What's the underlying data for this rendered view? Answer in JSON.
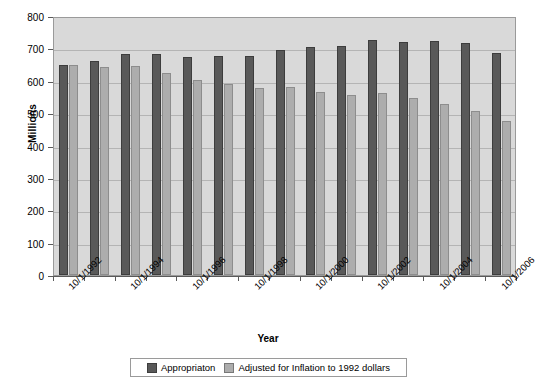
{
  "chart_data": {
    "type": "bar",
    "title": "",
    "xlabel": "Year",
    "ylabel": "Millions",
    "ylim": [
      0,
      800
    ],
    "ytick_step": 100,
    "yticks": [
      0,
      100,
      200,
      300,
      400,
      500,
      600,
      700,
      800
    ],
    "grid": true,
    "legend_position": "bottom",
    "categories": [
      "10/1/1992",
      "10/1/1993",
      "10/1/1994",
      "10/1/1995",
      "10/1/1996",
      "10/1/1997",
      "10/1/1998",
      "10/1/1999",
      "10/1/2000",
      "10/1/2001",
      "10/1/2002",
      "10/1/2003",
      "10/1/2004",
      "10/1/2005",
      "10/1/2006"
    ],
    "visible_tick_labels": [
      "10/1/1992",
      "",
      "10/1/1994",
      "",
      "10/1/1996",
      "",
      "10/1/1998",
      "",
      "10/1/2000",
      "",
      "10/1/2002",
      "",
      "10/1/2004",
      "",
      "10/1/2006"
    ],
    "series": [
      {
        "name": "Appropriaton",
        "color": "#595959",
        "values": [
          648,
          662,
          684,
          682,
          673,
          677,
          676,
          695,
          704,
          708,
          725,
          721,
          723,
          717,
          686
        ]
      },
      {
        "name": "Adjusted for Inflation to 1992 dollars",
        "color": "#adadad",
        "values": [
          650,
          641,
          645,
          625,
          601,
          589,
          578,
          581,
          566,
          556,
          561,
          546,
          527,
          507,
          477
        ]
      }
    ]
  },
  "legend": {
    "entries": [
      {
        "label": "Appropriaton",
        "color": "#595959"
      },
      {
        "label": "Adjusted for Inflation to 1992 dollars",
        "color": "#adadad"
      }
    ]
  },
  "colors": {
    "series_dark": "#595959",
    "series_light": "#adadad",
    "plot_background": "#d9d9d9",
    "gridline": "#b4b4b4",
    "axis": "#5a5a5a",
    "page_background": "#ffffff"
  }
}
